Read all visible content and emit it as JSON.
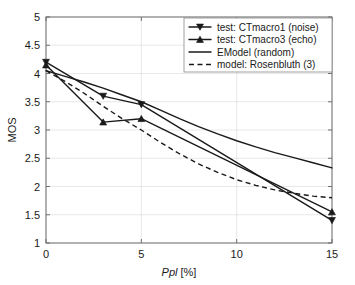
{
  "chart_data": {
    "type": "line",
    "title": "",
    "xlabel": "Ppl [%]",
    "xlabel_italic_part": "Ppl",
    "xlabel_rest": " [%]",
    "ylabel": "MOS",
    "xlim": [
      0,
      15
    ],
    "ylim": [
      1,
      5
    ],
    "xticks": [
      0,
      5,
      10,
      15
    ],
    "xticklabels": [
      "0",
      "5",
      "10",
      "15"
    ],
    "yticks": [
      1,
      1.5,
      2,
      2.5,
      3,
      3.5,
      4,
      4.5,
      5
    ],
    "yticklabels": [
      "1",
      "1.5",
      "2",
      "2.5",
      "3",
      "3.5",
      "4",
      "4.5",
      "5"
    ],
    "grid": true,
    "legend_position": "upper right",
    "series": [
      {
        "name": "test: CTmacro1 (noise)",
        "style": "solid",
        "marker": "triangle-down",
        "color": "#1a1a1a",
        "x": [
          0,
          3,
          5,
          15
        ],
        "values": [
          4.2,
          3.6,
          3.45,
          1.4
        ]
      },
      {
        "name": "test: CTmacro3 (echo)",
        "style": "solid",
        "marker": "triangle-up",
        "color": "#1a1a1a",
        "x": [
          0,
          3,
          5,
          15
        ],
        "values": [
          4.15,
          3.14,
          3.2,
          1.55
        ]
      },
      {
        "name": "EModel (random)",
        "style": "solid",
        "marker": "none",
        "color": "#1a1a1a",
        "x": [
          0,
          1,
          2,
          3,
          4,
          5,
          6,
          7,
          8,
          9,
          10,
          11,
          12,
          13,
          14,
          15
        ],
        "values": [
          4.05,
          3.95,
          3.85,
          3.74,
          3.62,
          3.5,
          3.35,
          3.2,
          3.06,
          2.93,
          2.81,
          2.7,
          2.6,
          2.51,
          2.42,
          2.33
        ]
      },
      {
        "name": "model: Rosenbluth (3)",
        "style": "dashed",
        "marker": "none",
        "color": "#1a1a1a",
        "x": [
          0,
          1,
          2,
          3,
          4,
          5,
          6,
          7,
          8,
          9,
          10,
          11,
          12,
          13,
          14,
          15
        ],
        "values": [
          4.05,
          3.86,
          3.65,
          3.42,
          3.2,
          3.0,
          2.78,
          2.58,
          2.4,
          2.25,
          2.12,
          2.02,
          1.94,
          1.88,
          1.83,
          1.8
        ]
      }
    ]
  },
  "legend": {
    "entries": [
      {
        "label": "test: CTmacro1 (noise)",
        "marker": "triangle-down",
        "style": "solid"
      },
      {
        "label": "test: CTmacro3 (echo)",
        "marker": "triangle-up",
        "style": "solid"
      },
      {
        "label": "EModel (random)",
        "marker": "none",
        "style": "solid"
      },
      {
        "label": "model: Rosenbluth (3)",
        "marker": "none",
        "style": "dashed"
      }
    ]
  },
  "colors": {
    "background": "#ffffff",
    "axis": "#6f6f6f",
    "grid": "#d9d9d9",
    "ink": "#1a1a1a"
  }
}
